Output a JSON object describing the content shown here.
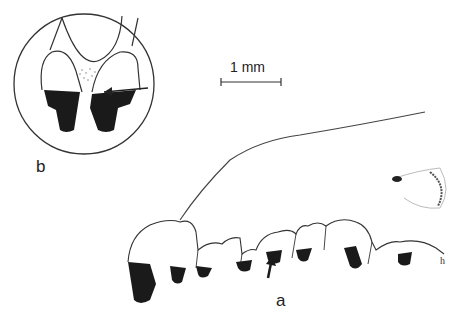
{
  "figure": {
    "panels": [
      {
        "id": "b",
        "label": "b",
        "description": "circular inset: enlarged frontal view of two teeth with arrow pointing to worn area"
      },
      {
        "id": "a",
        "label": "a",
        "description": "lateral view of jaw with tooth row; arrow pointing to a tooth"
      }
    ],
    "scale_bar": {
      "text": "1 mm"
    },
    "small_annotation": "h"
  },
  "colors": {
    "ink": "#1a1a1a",
    "background": "#ffffff",
    "stipple": "#888888"
  }
}
